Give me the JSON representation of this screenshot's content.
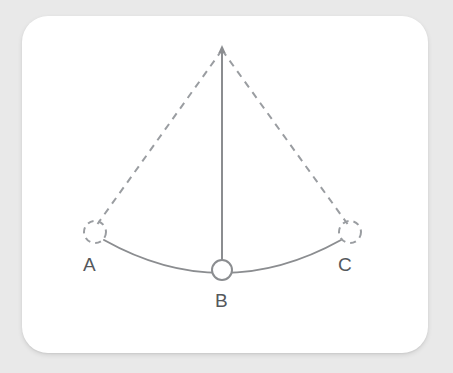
{
  "scene": {
    "background_color": "#e9e9e9",
    "card": {
      "background_color": "#ffffff",
      "x": 22,
      "y": 16,
      "width": 406,
      "height": 337,
      "corner_radius": 26
    }
  },
  "diagram": {
    "type": "pendulum-swing-diagram",
    "stroke_color": "#8b8d90",
    "dashed_stroke_color": "#9a9da1",
    "label_color": "#55585c",
    "pivot": {
      "name": "pivot-point",
      "x": 222,
      "y": 48
    },
    "points": [
      {
        "id": "A",
        "label": "A",
        "x": 95,
        "y": 232,
        "marker": "dashed-circle",
        "radius": 11,
        "label_x": 83,
        "label_y": 255
      },
      {
        "id": "B",
        "label": "B",
        "x": 222,
        "y": 270,
        "marker": "solid-circle",
        "radius": 10,
        "label_x": 215,
        "label_y": 291
      },
      {
        "id": "C",
        "label": "C",
        "x": 350,
        "y": 232,
        "marker": "dashed-circle",
        "radius": 11,
        "label_x": 338,
        "label_y": 255
      }
    ],
    "segments": [
      {
        "id": "pivot-to-a",
        "from": "pivot",
        "to": "A",
        "style": "dashed"
      },
      {
        "id": "pivot-to-b",
        "from": "pivot",
        "to": "B",
        "style": "solid",
        "arrow_at": "pivot"
      },
      {
        "id": "pivot-to-c",
        "from": "pivot",
        "to": "C",
        "style": "dashed"
      }
    ],
    "arc": {
      "id": "swing-arc",
      "style": "solid",
      "through": [
        "A",
        "B",
        "C"
      ]
    }
  },
  "labels": {
    "a": "A",
    "b": "B",
    "c": "C"
  }
}
